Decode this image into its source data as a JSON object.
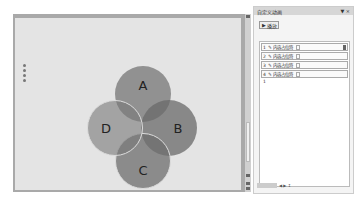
{
  "slide": {
    "circles": [
      {
        "label": "A"
      },
      {
        "label": "B"
      },
      {
        "label": "C"
      },
      {
        "label": "D"
      }
    ]
  },
  "pane": {
    "title": "自定义动画",
    "controls": "▼ ×",
    "play_label": "播放",
    "items": [
      {
        "num": "1",
        "label": "内容占位符"
      },
      {
        "num": "2",
        "label": "内容占位符"
      },
      {
        "num": "3",
        "label": "内容占位符"
      },
      {
        "num": "4",
        "label": "内容占位符"
      }
    ],
    "extra": "1",
    "footer": "◀ ▶ ↕"
  }
}
